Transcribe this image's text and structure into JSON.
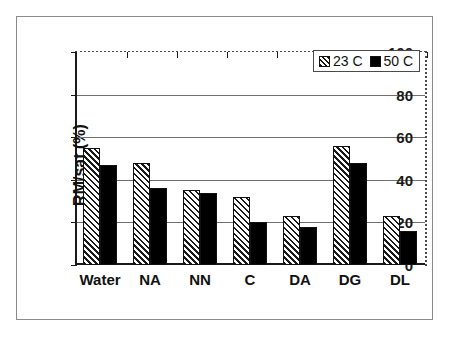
{
  "chart_data": {
    "type": "bar",
    "title": "",
    "xlabel": "",
    "ylabel": "RM/sat (%)",
    "ylim": [
      0,
      100
    ],
    "yticks": [
      0,
      20,
      40,
      60,
      80,
      100
    ],
    "ytick_labels": [
      "0",
      "20",
      "40",
      "60",
      "80",
      "100"
    ],
    "grid": true,
    "legend_position": "top-right",
    "categories": [
      "Water",
      "NA",
      "NN",
      "C",
      "DA",
      "DG",
      "DL"
    ],
    "series": [
      {
        "name": "23 C",
        "swatch": "hatched-diagonal",
        "color": "#ffffff",
        "values": [
          55,
          48,
          35,
          32,
          23,
          56,
          23
        ]
      },
      {
        "name": "50 C",
        "swatch": "solid-black",
        "color": "#000000",
        "values": [
          47,
          36,
          34,
          20,
          18,
          48,
          16
        ]
      }
    ]
  },
  "legend": {
    "items": [
      {
        "label": "23 C",
        "swatch_name": "legend-swatch-23c"
      },
      {
        "label": "50 C",
        "swatch_name": "legend-swatch-50c"
      }
    ]
  }
}
